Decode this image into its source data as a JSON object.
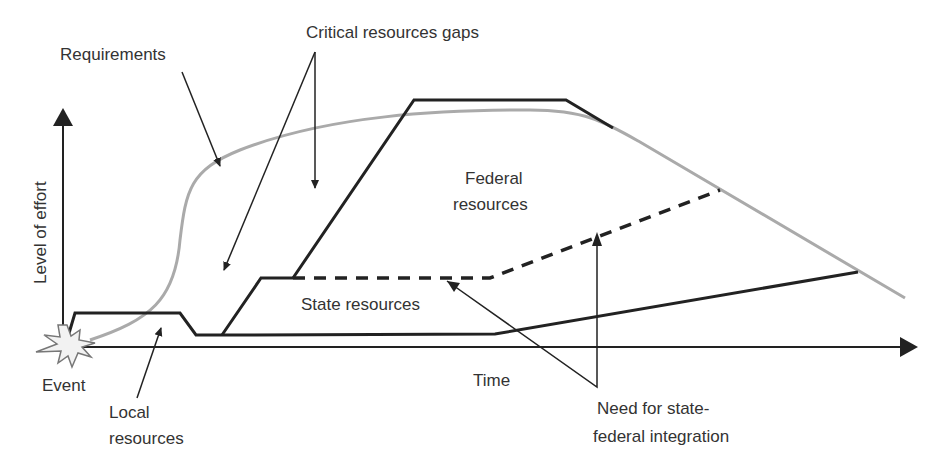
{
  "diagram": {
    "type": "conceptual resource-vs-requirements timeline",
    "axes": {
      "x_label": "Time",
      "y_label": "Level of effort"
    },
    "origin_label": "Event",
    "labels": {
      "requirements": "Requirements",
      "critical_gaps": "Critical resources gaps",
      "federal_line1": "Federal",
      "federal_line2": "resources",
      "state": "State resources",
      "local_line1": "Local",
      "local_line2": "resources",
      "need_line1": "Need for state-",
      "need_line2": "federal integration"
    },
    "colors": {
      "requirements_curve": "#aaaaaa",
      "resource_lines": "#222222",
      "text": "#333333"
    }
  }
}
